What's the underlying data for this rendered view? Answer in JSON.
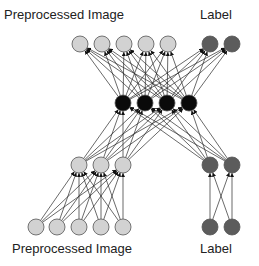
{
  "labels": {
    "top_image": "Preprocessed Image",
    "top_label": "Label",
    "bottom_image": "Preprocessed Image",
    "bottom_label": "Label"
  },
  "colors": {
    "image_node": "#d2d2d2",
    "label_node": "#5c5c5c",
    "shared_node": "#0a0a0a",
    "edge": "#2a2a2a"
  },
  "layers": {
    "output_image": {
      "y": 44,
      "x": [
        80,
        102,
        124,
        146,
        168
      ]
    },
    "output_label": {
      "y": 44,
      "x": [
        210,
        232
      ]
    },
    "shared": {
      "y": 103,
      "x": [
        123,
        145,
        167,
        189
      ]
    },
    "hidden_image": {
      "y": 165,
      "x": [
        79,
        101,
        123
      ]
    },
    "hidden_label": {
      "y": 165,
      "x": [
        210,
        232
      ]
    },
    "input_image": {
      "y": 227,
      "x": [
        36,
        57,
        79,
        101,
        123
      ]
    },
    "input_label": {
      "y": 227,
      "x": [
        210,
        232
      ]
    }
  },
  "node_radius": 8
}
